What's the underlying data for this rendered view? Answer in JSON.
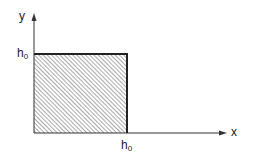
{
  "diagram": {
    "axes": {
      "x_label": "x",
      "y_label": "y"
    },
    "region": {
      "shape": "square",
      "fill": "diagonal-hatch",
      "side_label_x": {
        "base": "h",
        "subscript": "0"
      },
      "side_label_y": {
        "base": "h",
        "subscript": "0"
      }
    },
    "colors": {
      "line": "#222222",
      "hatch": "#555555",
      "background": "#ffffff"
    }
  }
}
